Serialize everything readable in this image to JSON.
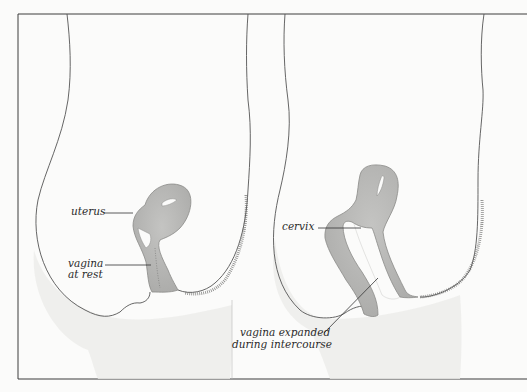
{
  "figure": {
    "title": "",
    "panels": [
      {
        "id": "at-rest",
        "labels": {
          "uterus": "uterus",
          "vagina_line1": "vagina",
          "vagina_line2": "at rest"
        }
      },
      {
        "id": "during-intercourse",
        "labels": {
          "cervix": "cervix",
          "vagina_line1": "vagina expanded",
          "vagina_line2": "during intercourse"
        }
      }
    ]
  },
  "colors": {
    "background": "#fbfbfa",
    "frame_border": "#3c3c3c",
    "outline": "#555555",
    "organ_fill": "#b9b9b7",
    "organ_stroke": "#8a8a88",
    "skin_shade": "#e4e4e2",
    "hair": "#5a5a58",
    "leader_line": "#333333"
  }
}
